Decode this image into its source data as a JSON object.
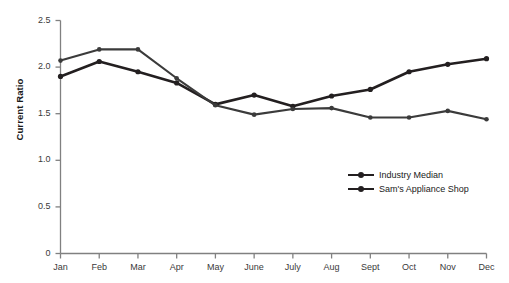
{
  "chart_data": {
    "type": "line",
    "title": "",
    "xlabel": "",
    "ylabel": "Current Ratio",
    "categories": [
      "Jan",
      "Feb",
      "Mar",
      "Apr",
      "May",
      "June",
      "July",
      "Aug",
      "Sept",
      "Oct",
      "Nov",
      "Dec"
    ],
    "ylim": [
      0,
      2.5
    ],
    "yticks": [
      "0",
      "0.5",
      "1.0",
      "1.5",
      "2.0",
      "2.5"
    ],
    "ytick_values": [
      0,
      0.5,
      1.0,
      1.5,
      2.0,
      2.5
    ],
    "grid": false,
    "legend_position": "inside-lower-right",
    "series": [
      {
        "name": "Industry Median",
        "color": "#231f20",
        "values": [
          1.9,
          2.06,
          1.95,
          1.83,
          1.6,
          1.7,
          1.58,
          1.69,
          1.76,
          1.95,
          2.03,
          2.09
        ]
      },
      {
        "name": "Sam's Appliance Shop",
        "color": "#3b3b3b",
        "values": [
          2.07,
          2.19,
          2.19,
          1.88,
          1.59,
          1.49,
          1.55,
          1.56,
          1.46,
          1.46,
          1.53,
          1.44
        ]
      }
    ]
  },
  "axis": {
    "y_title": "Current Ratio"
  },
  "legend": {
    "items": [
      {
        "label": "Industry Median"
      },
      {
        "label": "Sam's Appliance Shop"
      }
    ]
  }
}
